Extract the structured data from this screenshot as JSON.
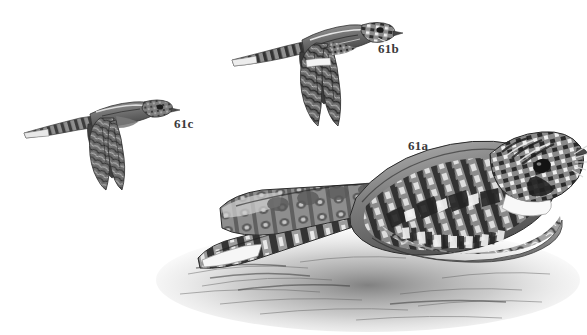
{
  "plate": {
    "medium": "grayscale pen-and-ink / engraving style bird illustration plate",
    "background_color": "#ffffff",
    "ink_color": "#3a3a3a",
    "width": 587,
    "height": 335
  },
  "labels": {
    "perched": "61a",
    "flight_upper": "61b",
    "flight_lower": "61c"
  },
  "figures": [
    {
      "id": "61a",
      "name": "perched-nightjar",
      "pose": "perched on ground, facing right",
      "features": "mottled brown-gray cryptic plumage, large dark eye, tiny bill, long white rictal bristles, white throat band, long barred tail crossed over folded wing, loose ground shading beneath"
    },
    {
      "id": "61b",
      "name": "flying-nightjar-upper",
      "pose": "in flight, facing right, wings swept down",
      "features": "long pointed wings, white wing-band near primaries, pale tail tip, barred upperparts"
    },
    {
      "id": "61c",
      "name": "flying-nightjar-lower",
      "pose": "in flight, facing right, wings swept down",
      "features": "long pointed wings without white wing-band, barred tail with pale tip, smaller scale"
    }
  ],
  "colors": {
    "ink_dark": "#2e2e2e",
    "ink_mid": "#6d6d6d",
    "ink_light": "#b6b6b6",
    "paper": "#ffffff",
    "label_text": "#3a3a3a"
  }
}
